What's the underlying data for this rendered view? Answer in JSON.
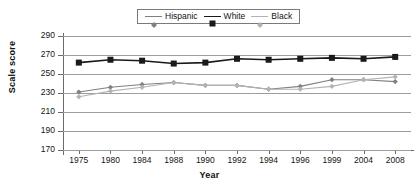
{
  "chart_data": {
    "type": "line",
    "title": "",
    "xlabel": "Year",
    "ylabel": "Scale score",
    "categories": [
      "1975",
      "1980",
      "1984",
      "1988",
      "1990",
      "1992",
      "1994",
      "1996",
      "1999",
      "2004",
      "2008"
    ],
    "ylim": [
      170,
      290
    ],
    "yticks": [
      290,
      270,
      250,
      230,
      210,
      190,
      170
    ],
    "grid": true,
    "legend_position": "top-center",
    "series": [
      {
        "name": "Hispanic",
        "color": "#808080",
        "marker": "diamond-small",
        "values": [
          231,
          236,
          239,
          241,
          238,
          238,
          234,
          237,
          244,
          244,
          242
        ]
      },
      {
        "name": "White",
        "color": "#1a1a1a",
        "marker": "square-filled",
        "values": [
          262,
          265,
          264,
          261,
          262,
          266,
          265,
          266,
          267,
          266,
          268
        ]
      },
      {
        "name": "Black",
        "color": "#b3b3b3",
        "marker": "diamond-small",
        "values": [
          226,
          232,
          236,
          241,
          238,
          238,
          234,
          234,
          237,
          244,
          247
        ]
      }
    ]
  },
  "axis": {
    "y_title": "Scale score",
    "x_title": "Year"
  },
  "legend": {
    "entries": [
      {
        "label": "Hispanic"
      },
      {
        "label": "White"
      },
      {
        "label": "Black"
      }
    ]
  }
}
